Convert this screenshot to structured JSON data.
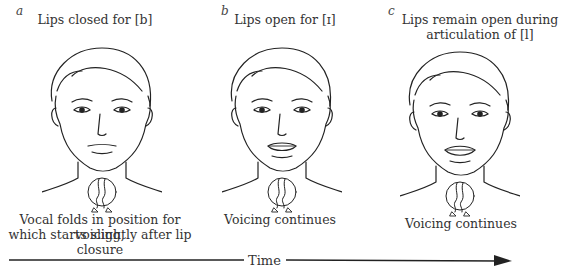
{
  "panels": [
    {
      "letter": "a",
      "title": "Lips closed for [b]",
      "title_line2": "",
      "caption_line1": "Vocal folds in position for voicing,",
      "caption_line2": "which starts slightly after lip closure",
      "mouth_state": "closed"
    },
    {
      "letter": "b",
      "title": "Lips open for [ɪ]",
      "title_line2": "",
      "caption_line1": "Voicing continues",
      "caption_line2": "",
      "mouth_state": "open"
    },
    {
      "letter": "c",
      "title": "Lips remain open during",
      "title_line2": "articulation of [l]",
      "caption_line1": "Voicing continues",
      "caption_line2": "",
      "mouth_state": "open"
    }
  ],
  "timeline": {
    "label": "Time",
    "direction": "left-to-right arrow"
  }
}
